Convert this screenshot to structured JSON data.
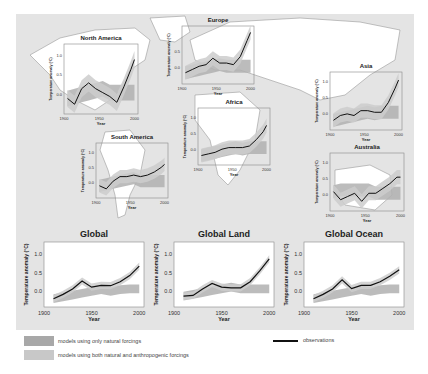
{
  "colors": {
    "background": "#e4e4e4",
    "land": "#ffffff",
    "natural_band": "#a8a8a8",
    "anthro_band": "#c4c4c4",
    "observations": "#111111",
    "axis": "#888888"
  },
  "legend": {
    "natural": "models using only natural forcings",
    "anthro": "models using both natural and anthropogenic forcings",
    "observations": "observations"
  },
  "chart_data": [
    {
      "type": "line",
      "title": "North America",
      "xlabel": "Year",
      "ylabel": "Temperature anomaly (°C)",
      "x": [
        1905,
        1915,
        1925,
        1935,
        1945,
        1955,
        1965,
        1975,
        1985,
        1995,
        2000
      ],
      "observations": [
        -0.1,
        -0.25,
        0.15,
        0.3,
        0.15,
        0.05,
        -0.05,
        -0.2,
        0.2,
        0.65,
        0.9
      ],
      "xticks": [
        1900,
        1950,
        2000
      ],
      "yticks": [
        0.0,
        0.5,
        1.0
      ],
      "xlim": [
        1900,
        2005
      ],
      "ylim": [
        -0.5,
        1.3
      ]
    },
    {
      "type": "line",
      "title": "Europe",
      "xlabel": "Year",
      "ylabel": "Temperature anomaly (°C)",
      "x": [
        1905,
        1915,
        1925,
        1935,
        1945,
        1955,
        1965,
        1975,
        1985,
        1995,
        2000
      ],
      "observations": [
        -0.15,
        -0.05,
        0.05,
        0.1,
        0.3,
        0.15,
        0.15,
        0.1,
        0.35,
        0.85,
        1.1
      ],
      "xticks": [
        1900,
        1950,
        2000
      ],
      "yticks": [
        0.0,
        0.5
      ],
      "xlim": [
        1900,
        2005
      ],
      "ylim": [
        -0.5,
        1.3
      ]
    },
    {
      "type": "line",
      "title": "Asia",
      "xlabel": "Year",
      "ylabel": "Temperature anomaly (°C)",
      "x": [
        1905,
        1915,
        1925,
        1935,
        1945,
        1955,
        1965,
        1975,
        1985,
        1995,
        2000
      ],
      "observations": [
        -0.2,
        -0.05,
        0.0,
        -0.05,
        0.1,
        0.1,
        0.05,
        0.05,
        0.35,
        0.8,
        1.05
      ],
      "xticks": [
        1900,
        1950,
        2000
      ],
      "yticks": [
        0.0,
        0.5,
        1.0
      ],
      "xlim": [
        1900,
        2005
      ],
      "ylim": [
        -0.5,
        1.3
      ]
    },
    {
      "type": "line",
      "title": "Africa",
      "xlabel": "Year",
      "ylabel": "Temperature anomaly (°C)",
      "x": [
        1905,
        1915,
        1925,
        1935,
        1945,
        1955,
        1965,
        1975,
        1985,
        1995,
        2000
      ],
      "observations": [
        -0.2,
        -0.15,
        -0.1,
        0.0,
        0.05,
        0.05,
        0.05,
        0.1,
        0.3,
        0.55,
        0.75
      ],
      "xticks": [
        1900,
        1950,
        2000
      ],
      "yticks": [
        0.0,
        0.5,
        1.0
      ],
      "xlim": [
        1900,
        2005
      ],
      "ylim": [
        -0.5,
        1.3
      ]
    },
    {
      "type": "line",
      "title": "South America",
      "xlabel": "Year",
      "ylabel": "Temperature anomaly (°C)",
      "x": [
        1905,
        1915,
        1925,
        1935,
        1945,
        1955,
        1965,
        1975,
        1985,
        1995,
        2000
      ],
      "observations": [
        -0.1,
        -0.2,
        0.05,
        0.2,
        0.2,
        0.25,
        0.2,
        0.25,
        0.35,
        0.5,
        0.6
      ],
      "xticks": [
        1900,
        1950,
        2000
      ],
      "yticks": [
        0.0,
        0.5,
        1.0
      ],
      "xlim": [
        1900,
        2005
      ],
      "ylim": [
        -0.5,
        1.3
      ]
    },
    {
      "type": "line",
      "title": "Australia",
      "xlabel": "Year",
      "ylabel": "Temperature anomaly (°C)",
      "x": [
        1905,
        1915,
        1925,
        1935,
        1945,
        1955,
        1965,
        1975,
        1985,
        1995,
        2000
      ],
      "observations": [
        0.1,
        -0.15,
        -0.05,
        0.05,
        -0.2,
        0.05,
        0.05,
        0.2,
        0.35,
        0.55,
        0.55
      ],
      "xticks": [
        1900,
        1950,
        2000
      ],
      "yticks": [
        0.0,
        0.5,
        1.0
      ],
      "xlim": [
        1900,
        2005
      ],
      "ylim": [
        -0.5,
        1.3
      ]
    },
    {
      "type": "line",
      "title": "Global",
      "xlabel": "Year",
      "ylabel": "Temperature anomaly (°C)",
      "x": [
        1910,
        1920,
        1930,
        1940,
        1950,
        1960,
        1970,
        1980,
        1990,
        2000
      ],
      "observations": [
        -0.22,
        -0.1,
        0.05,
        0.27,
        0.1,
        0.15,
        0.14,
        0.25,
        0.42,
        0.68
      ],
      "xticks": [
        1900,
        1950,
        2000
      ],
      "yticks": [
        0.0,
        0.5,
        1.0
      ],
      "xlim": [
        1900,
        2005
      ],
      "ylim": [
        -0.45,
        1.35
      ]
    },
    {
      "type": "line",
      "title": "Global Land",
      "xlabel": "Year",
      "ylabel": "Temperature anomaly (°C)",
      "x": [
        1910,
        1920,
        1930,
        1940,
        1950,
        1960,
        1970,
        1980,
        1990,
        2000
      ],
      "observations": [
        -0.15,
        -0.13,
        0.05,
        0.2,
        0.1,
        0.08,
        0.08,
        0.25,
        0.55,
        0.88
      ],
      "xticks": [
        1900,
        1950,
        2000
      ],
      "yticks": [
        0.0,
        0.5,
        1.0
      ],
      "xlim": [
        1900,
        2005
      ],
      "ylim": [
        -0.45,
        1.35
      ]
    },
    {
      "type": "line",
      "title": "Global Ocean",
      "xlabel": "Year",
      "ylabel": "Temperature anomaly (°C)",
      "x": [
        1910,
        1920,
        1930,
        1940,
        1950,
        1960,
        1970,
        1980,
        1990,
        2000
      ],
      "observations": [
        -0.22,
        -0.1,
        0.05,
        0.3,
        0.06,
        0.15,
        0.15,
        0.25,
        0.4,
        0.58
      ],
      "xticks": [
        1900,
        1950,
        2000
      ],
      "yticks": [
        0.0,
        0.5,
        1.0
      ],
      "xlim": [
        1900,
        2005
      ],
      "ylim": [
        -0.45,
        1.35
      ]
    }
  ],
  "panels": {
    "na": {
      "title": "North America",
      "t0": "1900",
      "t1": "1950",
      "t2": "2000",
      "xl": "Year",
      "yl": "Temperature anomaly (°C)",
      "y0": "0.0",
      "y1": "0.5",
      "y2": "1.0"
    },
    "eu": {
      "title": "Europe",
      "t0": "1900",
      "t1": "1950",
      "t2": "2000",
      "xl": "Year",
      "yl": "Temperature anomaly (°C)",
      "y0": "0.0",
      "y1": "0.5",
      "y2": ""
    },
    "as": {
      "title": "Asia",
      "t0": "1900",
      "t1": "1950",
      "t2": "2000",
      "xl": "Year",
      "yl": "Temperature anomaly (°C)",
      "y0": "0.0",
      "y1": "0.5",
      "y2": "1.0"
    },
    "af": {
      "title": "Africa",
      "t0": "1900",
      "t1": "1950",
      "t2": "2000",
      "xl": "Year",
      "yl": "Temperature anomaly (°C)",
      "y0": "0.0",
      "y1": "0.5",
      "y2": "1.0"
    },
    "sa": {
      "title": "South America",
      "t0": "1900",
      "t1": "1950",
      "t2": "2000",
      "xl": "Year",
      "yl": "Temperature anomaly (°C)",
      "y0": "0.0",
      "y1": "0.5",
      "y2": "1.0"
    },
    "au": {
      "title": "Australia",
      "t0": "1900",
      "t1": "1950",
      "t2": "2000",
      "xl": "Year",
      "yl": "Temperature anomaly (°C)",
      "y0": "0.0",
      "y1": "0.5",
      "y2": "1.0"
    },
    "gl": {
      "title": "Global",
      "t0": "1900",
      "t1": "1950",
      "t2": "2000",
      "xl": "Year",
      "yl": "Temperature anomaly (°C)",
      "y0": "0.0",
      "y1": "0.5",
      "y2": "1.0"
    },
    "gland": {
      "title": "Global Land",
      "t0": "1900",
      "t1": "1950",
      "t2": "2000",
      "xl": "Year",
      "yl": "Temperature anomaly (°C)",
      "y0": "0.0",
      "y1": "0.5",
      "y2": "1.0"
    },
    "gocean": {
      "title": "Global Ocean",
      "t0": "1900",
      "t1": "1950",
      "t2": "2000",
      "xl": "Year",
      "yl": "Temperature anomaly (°C)",
      "y0": "0.0",
      "y1": "0.5",
      "y2": "1.0"
    }
  }
}
